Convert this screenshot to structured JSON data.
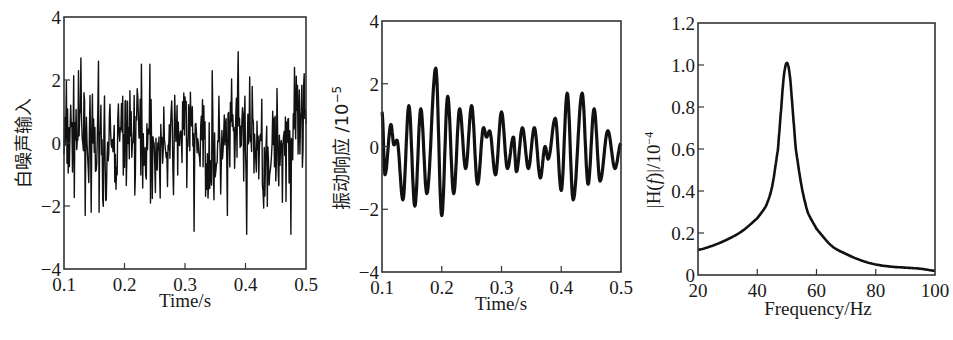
{
  "chart_data": [
    {
      "id": "white-noise-input",
      "type": "line",
      "title": "",
      "xlabel": "Time/s",
      "ylabel": "白噪声输入",
      "xlim": [
        0.1,
        0.5
      ],
      "ylim": [
        -4,
        4
      ],
      "xticks": [
        0.1,
        0.2,
        0.3,
        0.4,
        0.5
      ],
      "xtick_labels": [
        "0.1",
        "0.2",
        "0.3",
        "0.4",
        "0.5"
      ],
      "yticks": [
        -4,
        -2,
        0,
        2,
        4
      ],
      "ytick_labels": [
        "−4",
        "−2",
        "0",
        "2",
        "4"
      ],
      "grid": false,
      "legend": null,
      "series": [
        {
          "name": "white noise",
          "description": "random white noise, approx. amplitude within ±2.5, extremes ~+2.8 and ~−2.9",
          "seed": 7,
          "n_points": 400,
          "std": 0.9,
          "spikes": [
            {
              "x": 0.128,
              "y": 2.7
            },
            {
              "x": 0.157,
              "y": 2.6
            },
            {
              "x": 0.228,
              "y": 2.5
            },
            {
              "x": 0.242,
              "y": 2.5
            },
            {
              "x": 0.315,
              "y": -2.8
            },
            {
              "x": 0.345,
              "y": 2.3
            },
            {
              "x": 0.388,
              "y": 2.9
            },
            {
              "x": 0.402,
              "y": -2.9
            },
            {
              "x": 0.475,
              "y": -2.9
            },
            {
              "x": 0.481,
              "y": 2.4
            },
            {
              "x": 0.497,
              "y": 2.2
            },
            {
              "x": 0.145,
              "y": -2.2
            },
            {
              "x": 0.158,
              "y": -2.2
            },
            {
              "x": 0.37,
              "y": -2.3
            }
          ]
        }
      ]
    },
    {
      "id": "vibration-response",
      "type": "line",
      "title": "",
      "xlabel": "Time/s",
      "ylabel": "振动响应 /10⁻⁵",
      "xlim": [
        0.1,
        0.5
      ],
      "ylim": [
        -4,
        4
      ],
      "xticks": [
        0.1,
        0.2,
        0.3,
        0.4,
        0.5
      ],
      "xtick_labels": [
        "0.1",
        "0.2",
        "0.3",
        "0.4",
        "0.5"
      ],
      "yticks": [
        -4,
        -2,
        0,
        2,
        4
      ],
      "ytick_labels": [
        "−4",
        "−2",
        "0",
        "2",
        "4"
      ],
      "grid": false,
      "legend": null,
      "series": [
        {
          "name": "response",
          "x": [
            0.1,
            0.105,
            0.115,
            0.12,
            0.125,
            0.135,
            0.145,
            0.155,
            0.165,
            0.175,
            0.19,
            0.2,
            0.21,
            0.22,
            0.23,
            0.24,
            0.25,
            0.26,
            0.27,
            0.275,
            0.28,
            0.29,
            0.3,
            0.31,
            0.32,
            0.325,
            0.335,
            0.345,
            0.355,
            0.365,
            0.373,
            0.378,
            0.39,
            0.4,
            0.41,
            0.42,
            0.435,
            0.445,
            0.455,
            0.465,
            0.478,
            0.49,
            0.5
          ],
          "y": [
            1.1,
            -0.9,
            0.7,
            0.05,
            0.2,
            -1.7,
            1.3,
            -1.9,
            1.2,
            -1.5,
            2.5,
            -2.2,
            1.6,
            -1.5,
            1.2,
            -0.7,
            1.3,
            -1.2,
            0.6,
            0.3,
            0.5,
            -0.9,
            1.1,
            -0.7,
            0.3,
            -0.8,
            0.6,
            -0.7,
            0.6,
            -1.0,
            0.0,
            -0.4,
            0.9,
            -1.4,
            1.7,
            -1.7,
            1.7,
            -1.2,
            1.2,
            -1.1,
            0.5,
            -0.7,
            0.1
          ]
        }
      ]
    },
    {
      "id": "frequency-response",
      "type": "line",
      "title": "",
      "xlabel": "Frequency/Hz",
      "ylabel": "|H(f)|/10⁻⁴",
      "xlim": [
        20,
        100
      ],
      "ylim": [
        0,
        1.2
      ],
      "xticks": [
        20,
        40,
        60,
        80,
        100
      ],
      "xtick_labels": [
        "20",
        "40",
        "60",
        "80",
        "100"
      ],
      "yticks": [
        0,
        0.2,
        0.4,
        0.6,
        0.8,
        1.0,
        1.2
      ],
      "ytick_labels": [
        "0",
        "0.2",
        "0.4",
        "0.6",
        "0.8",
        "1.0",
        "1.2"
      ],
      "grid": false,
      "legend": null,
      "series": [
        {
          "name": "|H(f)|",
          "x": [
            20,
            25,
            30,
            35,
            40,
            43,
            45,
            47,
            48,
            49,
            50,
            51,
            52,
            53,
            55,
            57,
            60,
            65,
            70,
            75,
            80,
            85,
            90,
            95,
            100
          ],
          "y": [
            0.12,
            0.14,
            0.17,
            0.21,
            0.27,
            0.33,
            0.42,
            0.6,
            0.78,
            0.95,
            1.01,
            0.95,
            0.78,
            0.6,
            0.42,
            0.3,
            0.22,
            0.14,
            0.1,
            0.07,
            0.05,
            0.04,
            0.035,
            0.03,
            0.02
          ]
        }
      ]
    }
  ],
  "labels": {
    "c1_xlabel": "Time/s",
    "c1_ylabel": "白噪声输入",
    "c2_xlabel": "Time/s",
    "c2_ylabel_cn": "振动响应 /10",
    "c2_ylabel_exp": "−5",
    "c3_xlabel": "Frequency/Hz",
    "c3_ylabel_main": "|H(",
    "c3_ylabel_f": "f",
    "c3_ylabel_end": ")|/10",
    "c3_ylabel_exp": "−4"
  },
  "colors": {
    "line": "#111111",
    "frame": "#333333",
    "background": "#ffffff"
  }
}
